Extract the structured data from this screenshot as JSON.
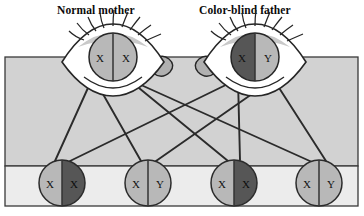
{
  "diagram": {
    "title_left": "Normal mother",
    "title_right": "Color-blind father",
    "type": "genetics-punnett-inheritance",
    "topic": "X-linked color blindness inheritance",
    "colors": {
      "panel_upper": "#d2d2d2",
      "panel_lower": "#ececec",
      "allele_normal": "#b8b8b8",
      "allele_affected": "#565656",
      "outline": "#2b2b2b",
      "sclera": "#ffffff",
      "tear_duct": "#b0b0b0",
      "text": "#111111"
    },
    "parents": [
      {
        "name": "mother",
        "label": "Normal mother",
        "cx": 113,
        "cy": 57,
        "r": 24,
        "alleles": [
          {
            "symbol": "X",
            "state": "normal",
            "side": "left"
          },
          {
            "symbol": "X",
            "state": "normal",
            "side": "right"
          }
        ]
      },
      {
        "name": "father",
        "label": "Color-blind father",
        "cx": 255,
        "cy": 57,
        "r": 24,
        "alleles": [
          {
            "symbol": "X",
            "state": "affected",
            "side": "left"
          },
          {
            "symbol": "Y",
            "state": "normal",
            "side": "right"
          }
        ]
      }
    ],
    "children": [
      {
        "name": "child-1",
        "cx": 62,
        "cy": 183,
        "r": 23,
        "alleles": [
          {
            "symbol": "X",
            "state": "normal",
            "side": "left"
          },
          {
            "symbol": "X",
            "state": "affected",
            "side": "right"
          }
        ]
      },
      {
        "name": "child-2",
        "cx": 148,
        "cy": 183,
        "r": 23,
        "alleles": [
          {
            "symbol": "X",
            "state": "normal",
            "side": "left"
          },
          {
            "symbol": "Y",
            "state": "normal",
            "side": "right"
          }
        ]
      },
      {
        "name": "child-3",
        "cx": 234,
        "cy": 183,
        "r": 23,
        "alleles": [
          {
            "symbol": "X",
            "state": "normal",
            "side": "left"
          },
          {
            "symbol": "X",
            "state": "affected",
            "side": "right"
          }
        ]
      },
      {
        "name": "child-4",
        "cx": 319,
        "cy": 183,
        "r": 23,
        "alleles": [
          {
            "symbol": "X",
            "state": "normal",
            "side": "left"
          },
          {
            "symbol": "Y",
            "state": "normal",
            "side": "right"
          }
        ]
      }
    ],
    "links": [
      {
        "from": "mother-X-left",
        "to": "child-1",
        "x1": 92,
        "y1": 79,
        "x2": 55,
        "y2": 161
      },
      {
        "from": "mother-X-left",
        "to": "child-2",
        "x1": 95,
        "y1": 80,
        "x2": 141,
        "y2": 161
      },
      {
        "from": "mother-X-right",
        "to": "child-3",
        "x1": 128,
        "y1": 79,
        "x2": 228,
        "y2": 161
      },
      {
        "from": "mother-X-right",
        "to": "child-4",
        "x1": 130,
        "y1": 80,
        "x2": 312,
        "y2": 162
      },
      {
        "from": "father-X-left",
        "to": "child-1",
        "x1": 236,
        "y1": 80,
        "x2": 70,
        "y2": 161
      },
      {
        "from": "father-X-left",
        "to": "child-3",
        "x1": 238,
        "y1": 79,
        "x2": 240,
        "y2": 160
      },
      {
        "from": "father-Y-right",
        "to": "child-2",
        "x1": 272,
        "y1": 80,
        "x2": 156,
        "y2": 161
      },
      {
        "from": "father-Y-right",
        "to": "child-4",
        "x1": 274,
        "y1": 80,
        "x2": 326,
        "y2": 161
      }
    ],
    "panel": {
      "x": 5,
      "y": 57,
      "width": 353,
      "height": 149,
      "divider_y": 166
    }
  }
}
